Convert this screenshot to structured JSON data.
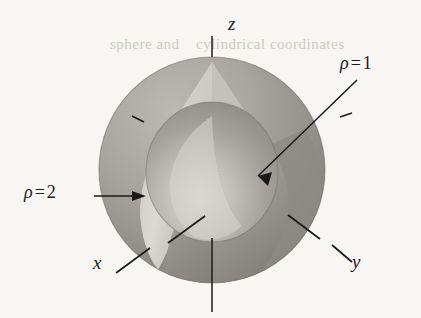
{
  "figure": {
    "kind": "3d-math-diagram",
    "background_color": "#f7f6f3",
    "ink_color": "#1a1a1a"
  },
  "axes": {
    "z": {
      "label": "z"
    },
    "x": {
      "label": "x"
    },
    "y": {
      "label": "y"
    }
  },
  "annotations": [
    {
      "id": "rho1",
      "symbol": "ρ",
      "operator": "=",
      "value": "1",
      "text": "ρ = 1",
      "points_to": "inner-sphere"
    },
    {
      "id": "rho2",
      "symbol": "ρ",
      "operator": "=",
      "value": "2",
      "text": "ρ = 2",
      "points_to": "outer-sphere"
    }
  ],
  "surfaces": {
    "outer_sphere": {
      "name": "rho = 2",
      "radius": 2,
      "shade_light": "#b9b6b1",
      "shade_mid": "#9d9a96",
      "shade_dark": "#84817d",
      "cut_face": "#cbc8c3"
    },
    "inner_sphere": {
      "name": "rho = 1",
      "radius": 1,
      "shade_light": "#d5d2cd",
      "shade_mid": "#a9a6a1",
      "shade_dark": "#8e8b87"
    }
  },
  "ghost_text": {
    "line1": "sphere and",
    "line2": "cylindrical coordinates"
  }
}
